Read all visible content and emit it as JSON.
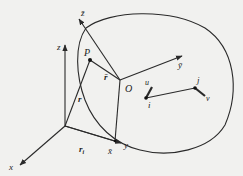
{
  "diagram": {
    "type": "rigid-body-kinematics",
    "background": "#f1f1ef",
    "stroke_color": "#2a2a2a",
    "fixed_frame": {
      "labels": {
        "x": "x",
        "y": "y",
        "z": "z"
      }
    },
    "body_frame": {
      "origin_label": "O",
      "labels": {
        "x": "x̄",
        "y": "ȳ",
        "z": "z̄"
      }
    },
    "points": {
      "P": "P",
      "i": "i",
      "j": "j"
    },
    "vectors": {
      "r": "r",
      "r_bar": "r̄",
      "r_i": "r",
      "r_i_sub": "i",
      "u": "u",
      "v": "v"
    }
  }
}
